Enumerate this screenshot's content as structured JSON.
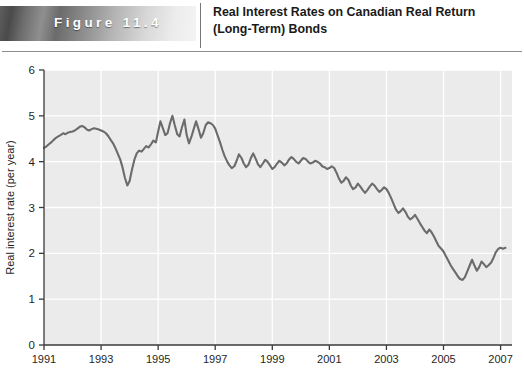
{
  "header": {
    "badge_label": "Figure  11.4",
    "title": "Real Interest Rates on Canadian Real Return (Long-Term) Bonds"
  },
  "chart_data": {
    "type": "line",
    "title": "Real Interest Rates on Canadian Real Return (Long-Term) Bonds",
    "xlabel": "",
    "ylabel": "Real interest rate (per year)",
    "xlim": [
      1991,
      2007.4
    ],
    "ylim": [
      0,
      6
    ],
    "yticks": [
      0,
      1,
      2,
      3,
      4,
      5,
      6
    ],
    "xticks": [
      1991,
      1993,
      1995,
      1997,
      1999,
      2001,
      2003,
      2005,
      2007
    ],
    "grid": true,
    "legend": null,
    "line_color": "#6b6b6b",
    "plot_bg": "#ebebeb",
    "grid_color": "#ffffff",
    "series": [
      {
        "name": "Real interest rate (per year)",
        "x": [
          1991.0,
          1991.08,
          1991.17,
          1991.25,
          1991.33,
          1991.42,
          1991.5,
          1991.58,
          1991.67,
          1991.75,
          1991.83,
          1991.92,
          1992.0,
          1992.08,
          1992.17,
          1992.25,
          1992.33,
          1992.42,
          1992.5,
          1992.58,
          1992.67,
          1992.75,
          1992.83,
          1992.92,
          1993.0,
          1993.08,
          1993.17,
          1993.25,
          1993.33,
          1993.42,
          1993.5,
          1993.58,
          1993.67,
          1993.75,
          1993.83,
          1993.92,
          1994.0,
          1994.08,
          1994.17,
          1994.25,
          1994.33,
          1994.42,
          1994.5,
          1994.58,
          1994.67,
          1994.75,
          1994.83,
          1994.92,
          1995.0,
          1995.08,
          1995.17,
          1995.25,
          1995.33,
          1995.42,
          1995.5,
          1995.58,
          1995.67,
          1995.75,
          1995.83,
          1995.92,
          1996.0,
          1996.08,
          1996.17,
          1996.25,
          1996.33,
          1996.42,
          1996.5,
          1996.58,
          1996.67,
          1996.75,
          1996.83,
          1996.92,
          1997.0,
          1997.08,
          1997.17,
          1997.25,
          1997.33,
          1997.42,
          1997.5,
          1997.58,
          1997.67,
          1997.75,
          1997.83,
          1997.92,
          1998.0,
          1998.08,
          1998.17,
          1998.25,
          1998.33,
          1998.42,
          1998.5,
          1998.58,
          1998.67,
          1998.75,
          1998.83,
          1998.92,
          1999.0,
          1999.08,
          1999.17,
          1999.25,
          1999.33,
          1999.42,
          1999.5,
          1999.58,
          1999.67,
          1999.75,
          1999.83,
          1999.92,
          2000.0,
          2000.08,
          2000.17,
          2000.25,
          2000.33,
          2000.42,
          2000.5,
          2000.58,
          2000.67,
          2000.75,
          2000.83,
          2000.92,
          2001.0,
          2001.08,
          2001.17,
          2001.25,
          2001.33,
          2001.42,
          2001.5,
          2001.58,
          2001.67,
          2001.75,
          2001.83,
          2001.92,
          2002.0,
          2002.08,
          2002.17,
          2002.25,
          2002.33,
          2002.42,
          2002.5,
          2002.58,
          2002.67,
          2002.75,
          2002.83,
          2002.92,
          2003.0,
          2003.08,
          2003.17,
          2003.25,
          2003.33,
          2003.42,
          2003.5,
          2003.58,
          2003.67,
          2003.75,
          2003.83,
          2003.92,
          2004.0,
          2004.08,
          2004.17,
          2004.25,
          2004.33,
          2004.42,
          2004.5,
          2004.58,
          2004.67,
          2004.75,
          2004.83,
          2004.92,
          2005.0,
          2005.08,
          2005.17,
          2005.25,
          2005.33,
          2005.42,
          2005.5,
          2005.58,
          2005.67,
          2005.75,
          2005.83,
          2005.92,
          2006.0,
          2006.08,
          2006.17,
          2006.25,
          2006.33,
          2006.42,
          2006.5,
          2006.58,
          2006.67,
          2006.75,
          2006.83,
          2006.92,
          2007.0,
          2007.08,
          2007.17
        ],
        "values": [
          4.3,
          4.33,
          4.38,
          4.42,
          4.47,
          4.52,
          4.55,
          4.58,
          4.62,
          4.6,
          4.63,
          4.65,
          4.66,
          4.68,
          4.72,
          4.76,
          4.78,
          4.75,
          4.7,
          4.68,
          4.71,
          4.73,
          4.72,
          4.7,
          4.68,
          4.66,
          4.62,
          4.56,
          4.48,
          4.4,
          4.3,
          4.18,
          4.05,
          3.88,
          3.66,
          3.48,
          3.58,
          3.82,
          4.05,
          4.18,
          4.24,
          4.22,
          4.28,
          4.34,
          4.31,
          4.38,
          4.46,
          4.42,
          4.66,
          4.88,
          4.72,
          4.58,
          4.62,
          4.85,
          5.0,
          4.8,
          4.6,
          4.55,
          4.74,
          4.92,
          4.58,
          4.4,
          4.55,
          4.72,
          4.88,
          4.7,
          4.52,
          4.62,
          4.8,
          4.86,
          4.84,
          4.8,
          4.72,
          4.58,
          4.42,
          4.26,
          4.12,
          4.0,
          3.92,
          3.86,
          3.9,
          4.02,
          4.16,
          4.08,
          3.96,
          3.88,
          3.94,
          4.08,
          4.18,
          4.06,
          3.94,
          3.88,
          3.96,
          4.04,
          4.0,
          3.92,
          3.84,
          3.88,
          3.96,
          4.02,
          3.98,
          3.92,
          3.96,
          4.04,
          4.1,
          4.06,
          4.0,
          3.96,
          4.02,
          4.08,
          4.06,
          4.0,
          3.96,
          3.98,
          4.02,
          4.0,
          3.96,
          3.9,
          3.88,
          3.84,
          3.86,
          3.9,
          3.86,
          3.76,
          3.64,
          3.54,
          3.58,
          3.66,
          3.6,
          3.48,
          3.4,
          3.44,
          3.52,
          3.46,
          3.38,
          3.32,
          3.38,
          3.46,
          3.52,
          3.48,
          3.4,
          3.34,
          3.38,
          3.44,
          3.4,
          3.32,
          3.2,
          3.08,
          2.96,
          2.88,
          2.92,
          2.98,
          2.9,
          2.8,
          2.74,
          2.78,
          2.84,
          2.76,
          2.66,
          2.58,
          2.5,
          2.44,
          2.52,
          2.46,
          2.36,
          2.26,
          2.16,
          2.1,
          2.04,
          1.94,
          1.84,
          1.74,
          1.66,
          1.58,
          1.5,
          1.44,
          1.42,
          1.48,
          1.6,
          1.74,
          1.86,
          1.74,
          1.62,
          1.7,
          1.82,
          1.76,
          1.7,
          1.74,
          1.8,
          1.9,
          2.02,
          2.1,
          2.12,
          2.1,
          2.12
        ]
      }
    ]
  }
}
